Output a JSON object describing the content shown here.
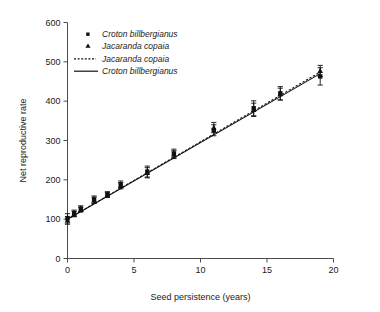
{
  "chart_data": {
    "type": "scatter",
    "title": "",
    "xlabel": "Seed persistence (years)",
    "ylabel": "Net reproductive rate",
    "xlim": [
      0,
      20
    ],
    "ylim": [
      0,
      600
    ],
    "xticks": [
      0,
      5,
      10,
      15,
      20
    ],
    "yticks": [
      0,
      100,
      200,
      300,
      400,
      500,
      600
    ],
    "xtick_labels": [
      "0",
      "5",
      "10",
      "15",
      "20"
    ],
    "ytick_labels": [
      "0",
      "100",
      "200",
      "300",
      "400",
      "500",
      "600"
    ],
    "grid": false,
    "legend_position": "top-left",
    "legend": [
      {
        "label": "Croton billbergianus",
        "marker": "square",
        "style": "marker"
      },
      {
        "label": "Jacaranda copaia",
        "marker": "triangle",
        "style": "marker"
      },
      {
        "label": "Jacaranda copaia",
        "marker": "none",
        "style": "dashed-line"
      },
      {
        "label": "Croton billbergianus",
        "marker": "none",
        "style": "solid-line"
      }
    ],
    "series": [
      {
        "name": "Croton billbergianus",
        "marker": "square",
        "x": [
          0,
          0.5,
          1,
          2,
          3,
          4,
          6,
          8,
          11,
          14,
          16,
          19
        ],
        "y": [
          102,
          115,
          127,
          150,
          163,
          188,
          221,
          267,
          326,
          382,
          420,
          463
        ],
        "yerr": [
          12,
          8,
          7,
          9,
          7,
          9,
          14,
          11,
          14,
          19,
          17,
          22
        ]
      },
      {
        "name": "Jacaranda copaia",
        "marker": "triangle",
        "x": [
          0,
          0.5,
          1,
          2,
          3,
          4,
          6,
          8,
          11,
          14,
          16,
          19
        ],
        "y": [
          97,
          113,
          124,
          148,
          161,
          185,
          218,
          264,
          333,
          378,
          418,
          477
        ],
        "yerr": [
          10,
          7,
          6,
          8,
          6,
          8,
          13,
          10,
          13,
          17,
          15,
          14
        ]
      }
    ],
    "fit_lines": [
      {
        "name": "Croton billbergianus",
        "style": "solid",
        "x": [
          0,
          19
        ],
        "y": [
          100,
          470
        ]
      },
      {
        "name": "Jacaranda copaia",
        "style": "dashed",
        "x": [
          0,
          19
        ],
        "y": [
          100,
          474
        ]
      }
    ]
  },
  "axes": {
    "y_title": "Net reproductive rate",
    "x_title": "Seed persistence (years)"
  }
}
